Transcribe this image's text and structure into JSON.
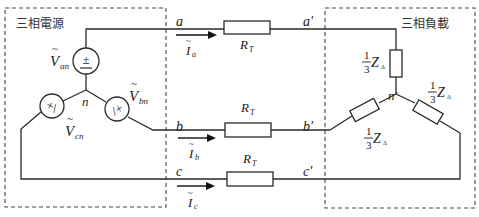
{
  "diagram": {
    "type": "three-phase Y-Y circuit",
    "source_box": {
      "label": "三相電源"
    },
    "load_box": {
      "label": "三相負載"
    },
    "source": {
      "neutral": "n",
      "voltages": [
        {
          "name": "V_an",
          "symbol": "V",
          "sub": "an",
          "tilde": "~"
        },
        {
          "name": "V_bn",
          "symbol": "V",
          "sub": "bn",
          "tilde": "~"
        },
        {
          "name": "V_cn",
          "symbol": "V",
          "sub": "cn",
          "tilde": "~"
        }
      ]
    },
    "lines": [
      {
        "from": "a",
        "to": "a'",
        "current": {
          "symbol": "I",
          "sub": "a",
          "tilde": "~"
        },
        "resistor": {
          "symbol": "R",
          "sub": "T"
        }
      },
      {
        "from": "b",
        "to": "b'",
        "current": {
          "symbol": "I",
          "sub": "b",
          "tilde": "~"
        },
        "resistor": {
          "symbol": "R",
          "sub": "T"
        }
      },
      {
        "from": "c",
        "to": "c'",
        "current": {
          "symbol": "I",
          "sub": "c",
          "tilde": "~"
        },
        "resistor": {
          "symbol": "R",
          "sub": "T"
        }
      }
    ],
    "load": {
      "neutral": "n'",
      "impedances": [
        {
          "num": "1",
          "den": "3",
          "symbol": "Z",
          "sub": "Δ"
        },
        {
          "num": "1",
          "den": "3",
          "symbol": "Z",
          "sub": "Δ"
        },
        {
          "num": "1",
          "den": "3",
          "symbol": "Z",
          "sub": "Δ"
        }
      ]
    },
    "colors": {
      "line": "#2a2a2a",
      "text": "#222222",
      "background": "#ffffff"
    }
  }
}
